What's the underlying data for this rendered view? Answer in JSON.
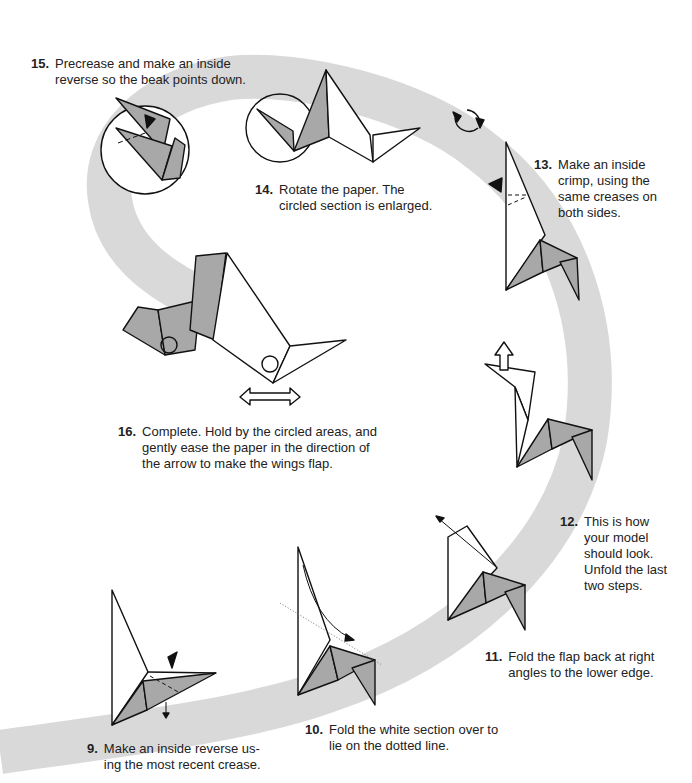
{
  "colors": {
    "band": "#d9d9d9",
    "paper_gray": "#a8a8a8",
    "paper_white": "#ffffff",
    "line": "#111111"
  },
  "steps": [
    {
      "id": "9",
      "number": "9.",
      "text": "Make an inside reverse us-\ning the most recent crease."
    },
    {
      "id": "10",
      "number": "10.",
      "text": "Fold the white section over to\nlie on the dotted line."
    },
    {
      "id": "11",
      "number": "11.",
      "text": "Fold the flap back at right\nangles to the lower edge."
    },
    {
      "id": "12",
      "number": "12.",
      "text": "This is how\nyour model\nshould look.\nUnfold the last\ntwo steps."
    },
    {
      "id": "13",
      "number": "13.",
      "text": "Make an inside\ncrimp, using the\nsame creases on\nboth sides."
    },
    {
      "id": "14",
      "number": "14.",
      "text": "Rotate the paper. The\ncircled section is enlarged."
    },
    {
      "id": "15",
      "number": "15.",
      "text": "Precrease and make an inside\nreverse so the beak points down."
    },
    {
      "id": "16",
      "number": "16.",
      "text": "Complete. Hold by the circled areas, and\ngently ease the paper in the direction of\nthe arrow to make the wings flap."
    }
  ],
  "icons": [
    "valley-fold-arrow-icon",
    "push-arrow-icon",
    "rotate-icon",
    "hollow-arrow-icon",
    "double-arrow-icon",
    "enlarge-circle-icon"
  ]
}
